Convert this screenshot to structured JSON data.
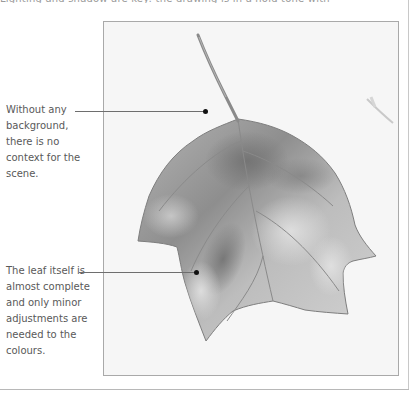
{
  "page": {
    "top_cutoff_text": "Lighting and shadow are key: the drawing is in a hold tone with subtle contrast"
  },
  "figure": {
    "colors": {
      "paper": "#f6f6f6",
      "frame_border": "#a9a9a9",
      "leaf_light": "#cfcfcf",
      "leaf_mid": "#a8a8a8",
      "leaf_dark": "#7d7d7d",
      "vein": "#8a8a8a",
      "leader_line": "#6e6e6e",
      "leader_dot": "#111111",
      "caption_text": "#595959"
    }
  },
  "annotations": [
    {
      "text": "Without any background, there is no context for the scene."
    },
    {
      "text": "The leaf itself is almost complete and only minor adjustments are needed to the colours."
    }
  ]
}
